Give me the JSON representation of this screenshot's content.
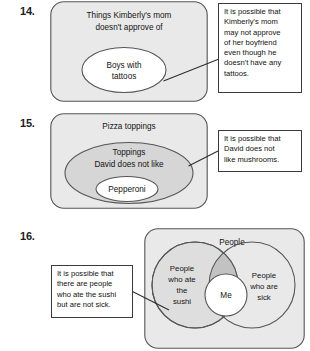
{
  "worksheet": {
    "problems": [
      {
        "number": "14.",
        "diagram": {
          "type": "nested-venn",
          "sets": [
            {
              "label_lines": [
                "Things Kimberly's mom",
                "doesn't approve of"
              ],
              "shape": "rounded-rect",
              "fill": "#e9e9e9"
            },
            {
              "label_lines": [
                "Boys with",
                "tattoos"
              ],
              "shape": "ellipse",
              "fill": "#ffffff"
            }
          ]
        },
        "callout": {
          "lines": [
            "It is possible that",
            "Kimberly's mom",
            "may not approve",
            "of her boyfriend",
            "even though he",
            "doesn't have any",
            "tattoos."
          ]
        }
      },
      {
        "number": "15.",
        "diagram": {
          "type": "nested-venn",
          "sets": [
            {
              "label_lines": [
                "Pizza toppings"
              ],
              "shape": "rounded-rect",
              "fill": "#e9e9e9"
            },
            {
              "label_lines": [
                "Toppings",
                "David does not like"
              ],
              "shape": "ellipse",
              "fill": "#d6d6d6"
            },
            {
              "label_lines": [
                "Pepperoni"
              ],
              "shape": "ellipse",
              "fill": "#ffffff"
            }
          ]
        },
        "callout": {
          "lines": [
            "It is possible that",
            "David does not",
            "like mushrooms."
          ]
        }
      },
      {
        "number": "16.",
        "diagram": {
          "type": "overlapping-venn",
          "sets": [
            {
              "label_lines": [
                "People"
              ],
              "shape": "rounded-rect",
              "fill": "#e9e9e9"
            },
            {
              "label_lines": [
                "People",
                "who ate",
                "the",
                "sushi"
              ],
              "shape": "circle",
              "fill": "#dedede"
            },
            {
              "label_lines": [
                "People",
                "who are",
                "sick"
              ],
              "shape": "circle",
              "fill": "#e9e9e9"
            },
            {
              "label_lines": [
                "Me"
              ],
              "shape": "circle",
              "fill": "#ffffff"
            }
          ]
        },
        "callout": {
          "lines": [
            "It is possible that",
            "there are people",
            "who ate the sushi",
            "but are not sick."
          ]
        }
      }
    ],
    "colors": {
      "outer_fill": "#e9e9e9",
      "mid_fill": "#d6d6d6",
      "inner_fill": "#ffffff",
      "overlap_fill": "#c2c2c2",
      "stroke": "#565656",
      "callout_border": "#3a3a3a",
      "text": "#141414"
    }
  }
}
